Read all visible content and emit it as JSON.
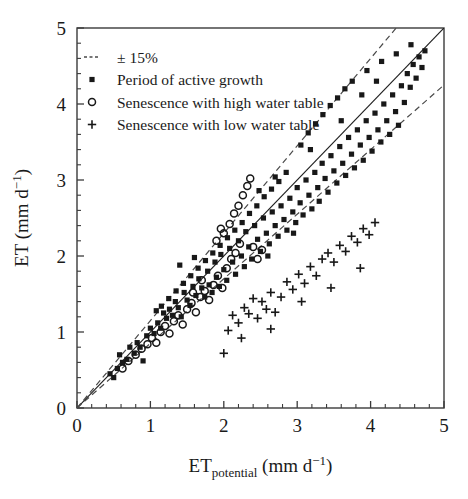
{
  "chart_data": {
    "type": "scatter",
    "title": "",
    "xlabel": "ETpotential (mm d-1)",
    "ylabel": "ET (mm d-1)",
    "xlabel_main": "ET",
    "xlabel_subscript": "potential",
    "xlabel_units_pre": " (mm d",
    "xlabel_units_sup": "−1",
    "xlabel_units_post": ")",
    "ylabel_main": "ET (mm d",
    "ylabel_sup": "−1",
    "ylabel_post": ")",
    "xlim": [
      0,
      5
    ],
    "ylim": [
      0,
      5
    ],
    "xticks": [
      0,
      1,
      2,
      3,
      4,
      5
    ],
    "yticks": [
      0,
      1,
      2,
      3,
      4,
      5
    ],
    "xtick_labels": [
      "0",
      "1",
      "2",
      "3",
      "4",
      "5"
    ],
    "ytick_labels": [
      "0",
      "1",
      "2",
      "3",
      "4",
      "5"
    ],
    "minor_tick_step": 0.2,
    "grid": false,
    "reference_lines": [
      {
        "name": "one-to-one",
        "slope": 1.0,
        "intercept": 0,
        "style": "solid"
      },
      {
        "name": "plus-15-percent",
        "slope": 1.15,
        "intercept": 0,
        "style": "dashed"
      },
      {
        "name": "minus-15-percent",
        "slope": 0.85,
        "intercept": 0,
        "style": "dashed"
      }
    ],
    "legend": {
      "position": "top-left",
      "entries": [
        {
          "marker": "dashed-line",
          "label": "± 15%"
        },
        {
          "marker": "filled-square",
          "label": "Period of active growth"
        },
        {
          "marker": "open-circle",
          "label": "Senescence with high water table"
        },
        {
          "marker": "plus",
          "label": "Senescence with low water table"
        }
      ]
    },
    "series": [
      {
        "name": "Period of active growth",
        "marker": "filled-square",
        "color": "#181818",
        "points": [
          [
            0.45,
            0.45
          ],
          [
            0.5,
            0.4
          ],
          [
            0.55,
            0.52
          ],
          [
            0.62,
            0.6
          ],
          [
            0.68,
            0.64
          ],
          [
            0.72,
            0.8
          ],
          [
            0.78,
            0.72
          ],
          [
            0.82,
            0.86
          ],
          [
            0.86,
            0.8
          ],
          [
            0.9,
            0.62
          ],
          [
            0.95,
            0.95
          ],
          [
            1.0,
            1.05
          ],
          [
            1.05,
            0.98
          ],
          [
            1.1,
            1.12
          ],
          [
            1.14,
            1.05
          ],
          [
            1.18,
            1.25
          ],
          [
            1.22,
            1.18
          ],
          [
            1.26,
            1.3
          ],
          [
            1.3,
            1.22
          ],
          [
            1.34,
            1.4
          ],
          [
            1.38,
            1.32
          ],
          [
            1.42,
            1.2
          ],
          [
            1.46,
            1.52
          ],
          [
            1.5,
            1.42
          ],
          [
            1.54,
            1.35
          ],
          [
            1.58,
            1.6
          ],
          [
            1.62,
            1.48
          ],
          [
            1.66,
            1.7
          ],
          [
            1.7,
            1.58
          ],
          [
            1.74,
            1.46
          ],
          [
            1.78,
            1.8
          ],
          [
            1.8,
            1.62
          ],
          [
            1.84,
            1.52
          ],
          [
            1.88,
            1.92
          ],
          [
            1.9,
            1.72
          ],
          [
            1.94,
            1.6
          ],
          [
            1.96,
            2.02
          ],
          [
            2.0,
            1.82
          ],
          [
            2.04,
            1.68
          ],
          [
            2.08,
            2.1
          ],
          [
            2.12,
            1.92
          ],
          [
            2.16,
            1.76
          ],
          [
            2.2,
            2.2
          ],
          [
            2.24,
            2.0
          ],
          [
            2.28,
            1.86
          ],
          [
            2.3,
            2.32
          ],
          [
            2.34,
            2.12
          ],
          [
            2.38,
            1.96
          ],
          [
            2.42,
            2.4
          ],
          [
            2.46,
            2.22
          ],
          [
            2.5,
            2.06
          ],
          [
            2.54,
            2.5
          ],
          [
            2.58,
            2.3
          ],
          [
            2.62,
            2.16
          ],
          [
            2.66,
            2.58
          ],
          [
            2.7,
            2.4
          ],
          [
            2.74,
            2.26
          ],
          [
            2.78,
            2.66
          ],
          [
            2.82,
            2.48
          ],
          [
            2.86,
            2.34
          ],
          [
            2.9,
            2.76
          ],
          [
            2.94,
            2.58
          ],
          [
            2.98,
            2.44
          ],
          [
            3.0,
            2.9
          ],
          [
            3.04,
            2.7
          ],
          [
            3.08,
            2.54
          ],
          [
            3.12,
            3.0
          ],
          [
            3.16,
            2.8
          ],
          [
            3.2,
            2.62
          ],
          [
            3.24,
            3.1
          ],
          [
            3.28,
            2.9
          ],
          [
            3.3,
            2.72
          ],
          [
            3.34,
            3.22
          ],
          [
            3.38,
            3.02
          ],
          [
            3.42,
            2.84
          ],
          [
            3.46,
            3.32
          ],
          [
            3.5,
            3.12
          ],
          [
            3.54,
            2.96
          ],
          [
            3.58,
            3.44
          ],
          [
            3.62,
            3.22
          ],
          [
            3.66,
            3.06
          ],
          [
            3.7,
            3.56
          ],
          [
            3.74,
            3.34
          ],
          [
            3.78,
            3.16
          ],
          [
            3.82,
            3.66
          ],
          [
            3.86,
            3.46
          ],
          [
            3.9,
            3.26
          ],
          [
            3.94,
            3.78
          ],
          [
            3.98,
            3.56
          ],
          [
            4.02,
            3.38
          ],
          [
            4.06,
            3.88
          ],
          [
            4.1,
            3.66
          ],
          [
            4.14,
            3.5
          ],
          [
            4.18,
            4.0
          ],
          [
            4.22,
            3.78
          ],
          [
            4.26,
            3.6
          ],
          [
            4.3,
            4.12
          ],
          [
            4.34,
            3.9
          ],
          [
            4.38,
            3.72
          ],
          [
            4.42,
            4.24
          ],
          [
            4.46,
            4.02
          ],
          [
            4.5,
            4.4
          ],
          [
            4.54,
            4.22
          ],
          [
            4.58,
            4.52
          ],
          [
            4.62,
            4.34
          ],
          [
            4.66,
            4.62
          ],
          [
            4.7,
            4.48
          ],
          [
            4.74,
            4.7
          ],
          [
            3.05,
            3.46
          ],
          [
            3.15,
            3.62
          ],
          [
            3.25,
            3.74
          ],
          [
            3.35,
            3.86
          ],
          [
            2.85,
            3.1
          ],
          [
            2.75,
            2.98
          ],
          [
            2.65,
            2.88
          ],
          [
            2.55,
            2.78
          ],
          [
            2.45,
            2.66
          ],
          [
            2.35,
            2.56
          ],
          [
            2.25,
            2.44
          ],
          [
            2.15,
            2.34
          ],
          [
            2.05,
            2.24
          ],
          [
            1.95,
            2.14
          ],
          [
            1.85,
            2.04
          ],
          [
            1.75,
            1.94
          ],
          [
            1.65,
            1.84
          ],
          [
            1.55,
            1.74
          ],
          [
            1.45,
            1.64
          ],
          [
            1.35,
            1.54
          ],
          [
            1.25,
            1.44
          ],
          [
            1.15,
            1.34
          ],
          [
            3.45,
            3.98
          ],
          [
            3.55,
            4.08
          ],
          [
            3.65,
            4.2
          ],
          [
            3.75,
            4.3
          ],
          [
            3.95,
            4.44
          ],
          [
            4.15,
            4.56
          ],
          [
            4.35,
            4.66
          ],
          [
            4.55,
            4.78
          ],
          [
            2.95,
            2.3
          ],
          [
            2.6,
            2.0
          ],
          [
            1.6,
            1.98
          ],
          [
            1.4,
            1.88
          ],
          [
            2.7,
            3.04
          ],
          [
            3.6,
            3.78
          ],
          [
            3.88,
            4.12
          ],
          [
            0.58,
            0.7
          ],
          [
            1.08,
            1.28
          ],
          [
            2.48,
            2.86
          ],
          [
            3.18,
            3.4
          ],
          [
            4.08,
            4.3
          ]
        ]
      },
      {
        "name": "Senescence with high water table",
        "marker": "open-circle",
        "color": "#181818",
        "points": [
          [
            0.62,
            0.52
          ],
          [
            0.7,
            0.62
          ],
          [
            0.8,
            0.7
          ],
          [
            0.88,
            0.78
          ],
          [
            0.96,
            0.84
          ],
          [
            1.02,
            0.92
          ],
          [
            1.08,
            0.86
          ],
          [
            1.14,
            1.0
          ],
          [
            1.2,
            1.08
          ],
          [
            1.26,
            0.98
          ],
          [
            1.32,
            1.14
          ],
          [
            1.38,
            1.22
          ],
          [
            1.44,
            1.1
          ],
          [
            1.5,
            1.3
          ],
          [
            1.56,
            1.38
          ],
          [
            1.62,
            1.26
          ],
          [
            1.68,
            1.46
          ],
          [
            1.74,
            1.54
          ],
          [
            1.8,
            1.42
          ],
          [
            1.86,
            1.62
          ],
          [
            1.92,
            1.74
          ],
          [
            1.98,
            1.58
          ],
          [
            2.04,
            1.84
          ],
          [
            2.1,
            1.96
          ],
          [
            2.16,
            2.04
          ],
          [
            2.22,
            2.16
          ],
          [
            2.0,
            2.3
          ],
          [
            2.08,
            2.42
          ],
          [
            2.14,
            2.56
          ],
          [
            2.2,
            2.66
          ],
          [
            2.26,
            2.8
          ],
          [
            2.32,
            2.92
          ],
          [
            2.36,
            3.02
          ],
          [
            1.9,
            2.2
          ],
          [
            1.96,
            2.36
          ],
          [
            2.4,
            2.12
          ],
          [
            2.46,
            1.96
          ],
          [
            2.52,
            2.08
          ],
          [
            1.7,
            1.68
          ],
          [
            1.58,
            1.52
          ]
        ]
      },
      {
        "name": "Senescence with low water table",
        "marker": "plus",
        "color": "#181818",
        "points": [
          [
            2.0,
            0.72
          ],
          [
            2.06,
            1.02
          ],
          [
            2.12,
            1.22
          ],
          [
            2.2,
            1.12
          ],
          [
            2.28,
            1.32
          ],
          [
            2.34,
            1.24
          ],
          [
            2.4,
            1.44
          ],
          [
            2.46,
            1.18
          ],
          [
            2.52,
            1.4
          ],
          [
            2.58,
            1.3
          ],
          [
            2.64,
            1.52
          ],
          [
            2.7,
            1.26
          ],
          [
            2.78,
            1.46
          ],
          [
            2.86,
            1.66
          ],
          [
            2.94,
            1.56
          ],
          [
            3.02,
            1.76
          ],
          [
            3.1,
            1.64
          ],
          [
            3.18,
            1.86
          ],
          [
            3.26,
            1.74
          ],
          [
            3.34,
            1.96
          ],
          [
            3.42,
            2.04
          ],
          [
            3.5,
            1.92
          ],
          [
            3.58,
            2.14
          ],
          [
            3.66,
            2.06
          ],
          [
            3.74,
            2.26
          ],
          [
            3.82,
            2.18
          ],
          [
            3.9,
            2.36
          ],
          [
            3.98,
            2.28
          ],
          [
            4.06,
            2.44
          ],
          [
            2.24,
            0.92
          ],
          [
            2.64,
            1.04
          ],
          [
            3.06,
            1.4
          ],
          [
            3.46,
            1.58
          ],
          [
            3.86,
            1.84
          ]
        ]
      }
    ]
  }
}
